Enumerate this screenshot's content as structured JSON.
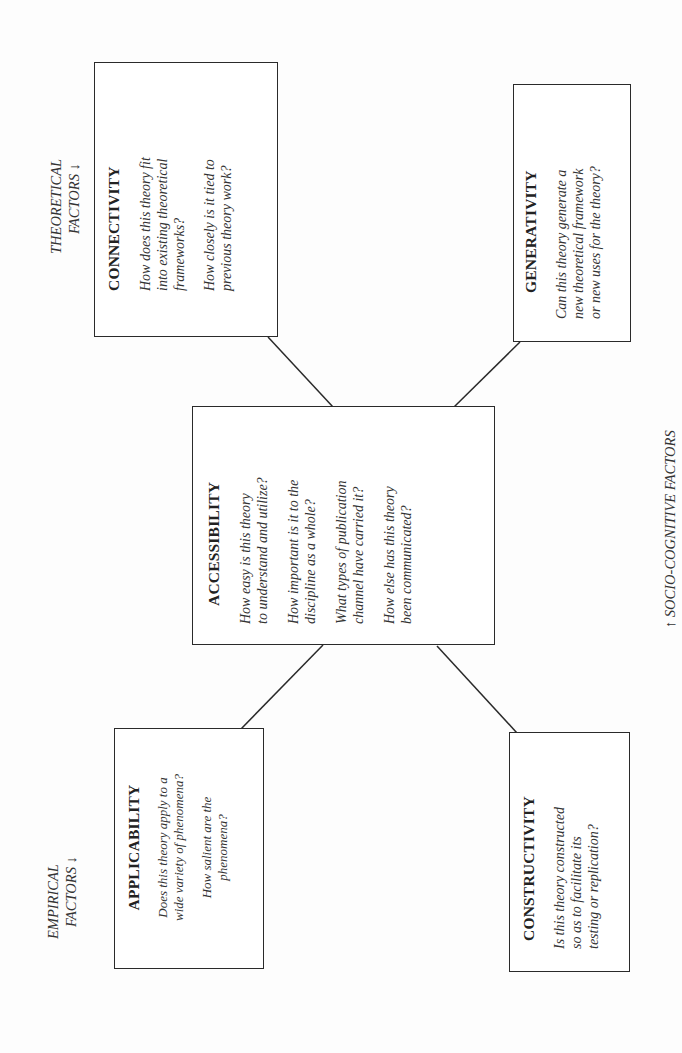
{
  "diagram": {
    "orientation": "rotated-90-ccw",
    "factor_labels": {
      "theoretical": {
        "line1": "THEORETICAL",
        "line2": "FACTORS ↓"
      },
      "empirical": {
        "line1": "EMPIRICAL",
        "line2": "FACTORS ↓"
      },
      "socio_cognitive": {
        "text": "↑  SOCIO-COGNITIVE FACTORS"
      }
    },
    "nodes": {
      "accessibility": {
        "title": "ACCESSIBILITY",
        "questions": [
          {
            "l1": "How easy is this theory",
            "l2": "to understand and utilize?"
          },
          {
            "l1": "How important is it to the",
            "l2": "discipline as a whole?"
          },
          {
            "l1": "What types of publication",
            "l2": "channel have carried it?"
          },
          {
            "l1": "How else has this theory",
            "l2": "been communicated?"
          }
        ]
      },
      "connectivity": {
        "title": "CONNECTIVITY",
        "questions": [
          {
            "l1": "How does this theory fit",
            "l2": "into existing theoretical",
            "l3": "frameworks?"
          },
          {
            "l1": "How closely is it tied to",
            "l2": "previous theory work?"
          }
        ]
      },
      "generativity": {
        "title": "GENERATIVITY",
        "questions": [
          {
            "l1": "Can this theory generate a",
            "l2": "new theoretical framework",
            "l3": "or new uses for the theory?"
          }
        ]
      },
      "applicability": {
        "title": "APPLICABILITY",
        "questions": [
          {
            "l1": "Does this theory apply to a",
            "l2": "wide variety of phenomena?"
          },
          {
            "l1": "How salient are the",
            "l2": "phenomena?"
          }
        ]
      },
      "constructivity": {
        "title": "CONSTRUCTIVITY",
        "questions": [
          {
            "l1": "Is this theory constructed",
            "l2": "so as to facilitate its",
            "l3": "testing or replication?"
          }
        ]
      }
    },
    "edges": [
      {
        "from": "accessibility",
        "to": "connectivity"
      },
      {
        "from": "accessibility",
        "to": "generativity"
      },
      {
        "from": "accessibility",
        "to": "applicability"
      },
      {
        "from": "accessibility",
        "to": "constructivity"
      }
    ],
    "colors": {
      "line": "#2a2a2a",
      "text": "#222222",
      "background": "#ffffff"
    }
  }
}
